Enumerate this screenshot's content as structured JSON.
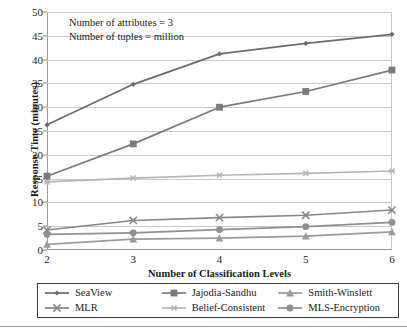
{
  "chart_data": {
    "type": "line",
    "title": "",
    "xlabel": "Number of Classification Levels",
    "ylabel": "Response Time (minutes)",
    "x": [
      2,
      3,
      4,
      5,
      6
    ],
    "xticklabels": [
      "2",
      "3",
      "4",
      "5",
      "6"
    ],
    "yticklabels": [
      "0",
      "5",
      "10",
      "15",
      "20",
      "25",
      "30",
      "35",
      "40",
      "45",
      "50"
    ],
    "yticks": [
      0,
      5,
      10,
      15,
      20,
      25,
      30,
      35,
      40,
      45,
      50
    ],
    "xlim": [
      2,
      6
    ],
    "ylim": [
      0,
      50
    ],
    "grid": "horizontal",
    "legend_position": "below-plot",
    "annotations": [
      "Number of attributes = 3",
      "Number of tuples = million"
    ],
    "series": [
      {
        "name": "SeaView",
        "marker": "diamond",
        "color": "#6b6b6b",
        "values": [
          26.3,
          34.8,
          41.2,
          43.4,
          45.3
        ]
      },
      {
        "name": "Jajodia-Sandhu",
        "marker": "square",
        "color": "#7a7a7a",
        "values": [
          15.5,
          22.3,
          30.0,
          33.3,
          37.8
        ]
      },
      {
        "name": "Smith-Winslett",
        "marker": "triangle",
        "color": "#9b9b9b",
        "values": [
          1.2,
          2.3,
          2.5,
          2.9,
          3.8
        ]
      },
      {
        "name": "MLR",
        "marker": "x",
        "color": "#868686",
        "values": [
          4.2,
          6.2,
          6.8,
          7.3,
          8.4
        ]
      },
      {
        "name": "Belief-Consistent",
        "marker": "asterisk",
        "color": "#b5b5b5",
        "values": [
          14.3,
          15.1,
          15.7,
          16.1,
          16.6
        ]
      },
      {
        "name": "MLS-Encryption",
        "marker": "circle",
        "color": "#8f8f8f",
        "values": [
          3.3,
          3.6,
          4.3,
          4.9,
          5.8
        ]
      }
    ]
  }
}
